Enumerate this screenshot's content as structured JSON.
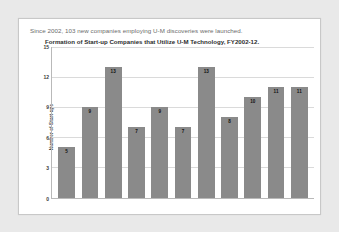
{
  "slide": {
    "headline": "Since 2002, 103 new companies employing U-M discoveries were launched.",
    "background_color": "#e9e9e9",
    "card_color": "#ffffff"
  },
  "chart_data": {
    "type": "bar",
    "title": "Formation of Start-up Companies that Utilize U-M Technology, FY2002-12.",
    "xlabel": "",
    "ylabel": "Number of Start-ups",
    "categories": [
      "",
      "",
      "",
      "",
      "",
      "",
      "",
      "",
      "",
      "",
      ""
    ],
    "values": [
      5,
      9,
      13,
      7,
      9,
      7,
      13,
      8,
      10,
      11,
      11
    ],
    "labels": [
      "5",
      "9",
      "13",
      "7",
      "9",
      "7",
      "13",
      "8",
      "10",
      "11",
      "11"
    ],
    "ylim": [
      0,
      15
    ],
    "yticks": [
      0,
      3,
      6,
      9,
      12,
      15
    ],
    "ytick_labels": [
      "0",
      "3",
      "6",
      "9",
      "12",
      "15"
    ],
    "grid": true,
    "grid_axis": "y",
    "legend": false,
    "bar_color": "#8a8a8a",
    "gridline_color": "#dadada",
    "axis_color": "#b9b9b9",
    "total": 103
  }
}
